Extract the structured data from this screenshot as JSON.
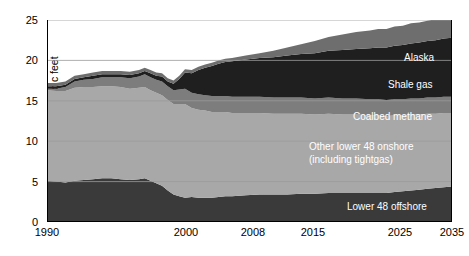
{
  "chart_data": {
    "type": "area",
    "stacked": true,
    "title": "",
    "subtitle": "",
    "xlabel": "",
    "ylabel": "trillion cubic feet",
    "ylim": [
      0,
      25
    ],
    "yticks": [
      0,
      5,
      10,
      15,
      20,
      25
    ],
    "ytick_labels": [
      "0",
      "5",
      "10",
      "15",
      "20",
      "25"
    ],
    "xticks": [
      1990,
      2000,
      2008,
      2015,
      2025,
      2035
    ],
    "xtick_labels": [
      "1990",
      "2000",
      "2008",
      "2015",
      "2025",
      "2035"
    ],
    "grid": "horizontal",
    "legend_position": "inline-annotations",
    "x": [
      1990,
      1991,
      1992,
      1993,
      1994,
      1995,
      1996,
      1997,
      1998,
      1999,
      2000,
      2001,
      2002,
      2003,
      2004,
      2005,
      2006,
      2007,
      2008,
      2009,
      2010,
      2011,
      2012,
      2013,
      2014,
      2015,
      2016,
      2017,
      2018,
      2019,
      2020,
      2021,
      2022,
      2023,
      2024,
      2025,
      2026,
      2027,
      2028,
      2029,
      2030,
      2031,
      2032,
      2033,
      2034,
      2035
    ],
    "series": [
      {
        "name": "Lower 48 offshore",
        "color": "#3a3a3a",
        "values": [
          5.1,
          5.0,
          4.9,
          5.1,
          5.2,
          5.3,
          5.4,
          5.4,
          5.3,
          5.2,
          5.3,
          5.4,
          5.1,
          4.8,
          4.5,
          3.9,
          3.4,
          3.2,
          3.0,
          3.1,
          3.0,
          3.0,
          3.0,
          3.1,
          3.2,
          3.2,
          3.3,
          3.4,
          3.4,
          3.4,
          3.5,
          3.5,
          3.6,
          3.6,
          3.6,
          3.6,
          3.6,
          3.6,
          3.7,
          3.8,
          3.9,
          4.0,
          4.1,
          4.2,
          4.3,
          4.4
        ]
      },
      {
        "name": "Other lower 48 onshore (including tightgas)",
        "color": "#a8a8a8",
        "values": [
          11.2,
          11.2,
          11.3,
          11.5,
          11.5,
          11.4,
          11.4,
          11.4,
          11.4,
          11.3,
          11.3,
          11.3,
          11.2,
          11.2,
          11.2,
          11.2,
          11.2,
          11.4,
          11.6,
          11.0,
          10.9,
          10.8,
          10.6,
          10.5,
          10.4,
          10.3,
          10.2,
          10.1,
          10.0,
          10.0,
          9.9,
          9.8,
          9.8,
          9.7,
          9.7,
          9.6,
          9.6,
          9.5,
          9.5,
          9.4,
          9.4,
          9.3,
          9.3,
          9.2,
          9.2,
          9.1
        ]
      },
      {
        "name": "Coalbed methane",
        "color": "#7d7d7d",
        "values": [
          0.2,
          0.3,
          0.5,
          0.8,
          0.9,
          1.0,
          1.1,
          1.1,
          1.2,
          1.3,
          1.4,
          1.6,
          1.6,
          1.6,
          1.7,
          1.7,
          1.7,
          1.8,
          1.9,
          1.9,
          1.9,
          1.9,
          2.0,
          2.0,
          2.0,
          2.0,
          2.0,
          2.0,
          2.0,
          2.0,
          2.0,
          2.0,
          2.0,
          2.0,
          2.0,
          2.0,
          2.0,
          2.0,
          2.0,
          2.0,
          2.0,
          2.0,
          2.0,
          2.0,
          2.0,
          2.0
        ]
      },
      {
        "name": "Shale gas",
        "color": "#1f1f1f",
        "values": [
          0.3,
          0.3,
          0.3,
          0.3,
          0.3,
          0.4,
          0.4,
          0.4,
          0.4,
          0.4,
          0.4,
          0.4,
          0.5,
          0.5,
          0.6,
          0.6,
          0.8,
          1.3,
          2.0,
          2.4,
          3.0,
          3.4,
          3.7,
          4.0,
          4.2,
          4.4,
          4.6,
          4.8,
          5.0,
          5.2,
          5.4,
          5.6,
          5.8,
          6.0,
          6.1,
          6.3,
          6.4,
          6.5,
          6.6,
          6.7,
          6.8,
          6.9,
          7.0,
          7.1,
          7.2,
          7.3
        ]
      },
      {
        "name": "Alaska",
        "color": "#6e6e6e",
        "values": [
          0.4,
          0.4,
          0.4,
          0.4,
          0.4,
          0.4,
          0.4,
          0.4,
          0.4,
          0.4,
          0.4,
          0.4,
          0.4,
          0.4,
          0.4,
          0.4,
          0.4,
          0.4,
          0.4,
          0.4,
          0.4,
          0.4,
          0.4,
          0.4,
          0.4,
          0.4,
          0.5,
          0.6,
          0.8,
          1.0,
          1.2,
          1.5,
          1.7,
          1.9,
          2.1,
          2.2,
          2.3,
          2.3,
          2.4,
          2.4,
          2.5,
          2.5,
          2.5,
          2.6,
          2.6,
          2.6
        ]
      }
    ],
    "annotations": [
      {
        "name": "alaska",
        "text": "Alaska"
      },
      {
        "name": "shale-gas",
        "text": "Shale gas"
      },
      {
        "name": "coalbed-methane",
        "text": "Coalbed  methane"
      },
      {
        "name": "other-lower-48-onshore-line1",
        "text": "Other lower 48 onshore"
      },
      {
        "name": "other-lower-48-onshore-line2",
        "text": "(including tightgas)"
      },
      {
        "name": "lower-48-offshore",
        "text": "Lower 48 offshore"
      }
    ]
  }
}
